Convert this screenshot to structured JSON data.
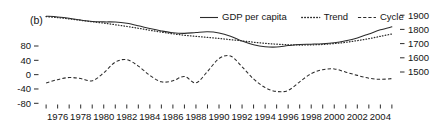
{
  "panel": {
    "label": "(b)"
  },
  "legend": {
    "position": "top-center",
    "entries": [
      {
        "label": "GDP per capita",
        "style": "solid",
        "name": "gdp-per-capita"
      },
      {
        "label": "Trend",
        "style": "dotted",
        "name": "trend"
      },
      {
        "label": "Cycle",
        "style": "dashed",
        "name": "cycle"
      }
    ]
  },
  "chart_data": {
    "type": "line",
    "title": "",
    "subtitle": "",
    "panel_label": "(b)",
    "xlabel": "",
    "ylabel": "",
    "grid": false,
    "legend_position": "top-center",
    "x": [
      1975,
      1976,
      1977,
      1978,
      1979,
      1980,
      1981,
      1982,
      1983,
      1984,
      1985,
      1986,
      1987,
      1988,
      1989,
      1990,
      1991,
      1992,
      1993,
      1994,
      1995,
      1996,
      1997,
      1998,
      1999,
      2000,
      2001,
      2002,
      2003,
      2004,
      2005
    ],
    "x_tick_labels": [
      "1976",
      "1978",
      "1980",
      "1982",
      "1984",
      "1986",
      "1988",
      "1990",
      "1992",
      "1994",
      "1996",
      "1998",
      "2000",
      "2002",
      "2004"
    ],
    "x_tick_values": [
      1976,
      1978,
      1980,
      1982,
      1984,
      1986,
      1988,
      1990,
      1992,
      1994,
      1996,
      1998,
      2000,
      2002,
      2004
    ],
    "xlim": [
      1974.6,
      2005.4
    ],
    "minor_ticks_every": 1,
    "left_axis": {
      "label": "",
      "tick_labels": [
        "80",
        "40",
        "0",
        "-40",
        "-80"
      ],
      "tick_values": [
        80,
        40,
        0,
        -40,
        -80
      ],
      "ylim": [
        -80,
        120
      ],
      "applies_to": [
        "Cycle"
      ]
    },
    "right_axis": {
      "label": "",
      "tick_labels": [
        "1900",
        "1800",
        "1700",
        "1600",
        "1500"
      ],
      "tick_values": [
        1900,
        1800,
        1700,
        1600,
        1500
      ],
      "ylim": [
        1440,
        1960
      ],
      "applies_to": [
        "GDP per capita",
        "Trend"
      ]
    },
    "series": [
      {
        "name": "GDP per capita",
        "axis": "right",
        "style": "solid",
        "values": [
          1893,
          1888,
          1879,
          1866,
          1856,
          1853,
          1852,
          1843,
          1826,
          1806,
          1789,
          1776,
          1772,
          1778,
          1783,
          1775,
          1752,
          1718,
          1692,
          1678,
          1676,
          1686,
          1694,
          1696,
          1699,
          1706,
          1720,
          1740,
          1768,
          1797,
          1818
        ]
      },
      {
        "name": "Trend",
        "axis": "right",
        "style": "dotted",
        "values": [
          1890,
          1883,
          1874,
          1864,
          1854,
          1844,
          1833,
          1821,
          1808,
          1794,
          1781,
          1769,
          1759,
          1751,
          1744,
          1736,
          1728,
          1719,
          1710,
          1702,
          1696,
          1692,
          1690,
          1691,
          1694,
          1700,
          1709,
          1721,
          1735,
          1751,
          1768
        ]
      },
      {
        "name": "Cycle",
        "axis": "left",
        "style": "dashed",
        "values": [
          -23,
          -14,
          -8,
          -11,
          -17,
          5,
          35,
          42,
          24,
          -2,
          -20,
          -17,
          -5,
          -23,
          9,
          45,
          52,
          22,
          -12,
          -36,
          -47,
          -44,
          -20,
          3,
          14,
          16,
          7,
          -2,
          -10,
          -13,
          -11
        ]
      }
    ]
  }
}
